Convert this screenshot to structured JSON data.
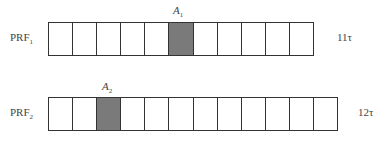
{
  "rows": [
    {
      "label": "PRF",
      "label_sub": "1",
      "cells": 11,
      "shaded_index": 5,
      "marker": "A",
      "marker_sub": "1",
      "period": "11τ"
    },
    {
      "label": "PRF",
      "label_sub": "2",
      "cells": 12,
      "shaded_index": 2,
      "marker": "A",
      "marker_sub": "2",
      "period": "12τ"
    }
  ],
  "colors": {
    "shaded": "#7a7a7a",
    "border": "#333333",
    "background": "#ffffff"
  }
}
